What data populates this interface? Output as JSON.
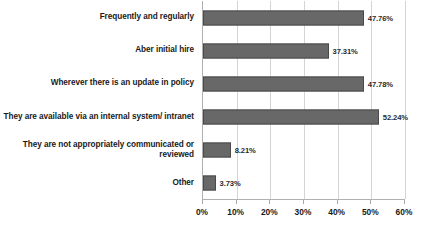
{
  "chart_data": {
    "type": "bar",
    "orientation": "horizontal",
    "title": "",
    "xlabel": "",
    "ylabel": "",
    "xlim": [
      0,
      60
    ],
    "grid": true,
    "legend": false,
    "tick_labels": [
      "0%",
      "10%",
      "20%",
      "30%",
      "40%",
      "50%",
      "60%"
    ],
    "tick_values": [
      0,
      10,
      20,
      30,
      40,
      50,
      60
    ],
    "categories": [
      "Frequently and regularly",
      "Aber initial hire",
      "Wherever there is an update in policy",
      "They are available via an internal system/ intranet",
      "They are not appropriately communicated or reviewed",
      "Other"
    ],
    "values": [
      47.76,
      37.31,
      47.78,
      52.24,
      8.21,
      3.73
    ],
    "value_labels": [
      "47.76%",
      "37.31%",
      "47.78%",
      "52.24%",
      "8.21%",
      "3.73%"
    ],
    "colors": {
      "bar_fill": "#686868",
      "bar_border": "#4a4a4a",
      "gridline": "#d4d4d4",
      "axis": "#b0b0b0",
      "text": "#1a1a1a"
    }
  }
}
